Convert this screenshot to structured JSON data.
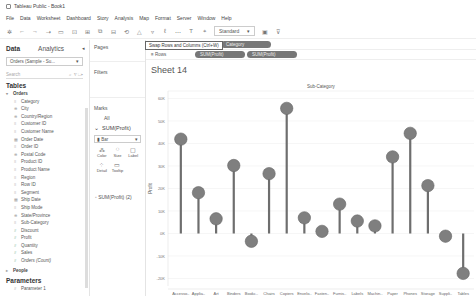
{
  "window": {
    "title": "Tableau Public - Book1"
  },
  "menu": [
    "File",
    "Data",
    "Worksheet",
    "Dashboard",
    "Story",
    "Analysis",
    "Map",
    "Format",
    "Server",
    "Window",
    "Help"
  ],
  "toolbar": {
    "icons": [
      "tableau-logo-icon",
      "back-icon",
      "forward-icon",
      "redo-icon",
      "save-icon",
      "new-datasource-icon",
      "new-sheet-icon",
      "duplicate-icon",
      "clear-icon",
      "swap-icon",
      "sort-asc-icon",
      "sort-desc-icon",
      "highlight-icon",
      "group-icon",
      "label-icon",
      "pin-icon"
    ],
    "fit_dropdown": "Standard",
    "tooltip": "Swap Rows and Columns (Ctrl+W)"
  },
  "left_pane": {
    "tabs": [
      "Data",
      "Analytics"
    ],
    "active_tab": "Data",
    "datasource": "Orders (Sample - Su...",
    "search_placeholder": "Search",
    "tables_heading": "Tables",
    "table_name": "Orders",
    "fields": [
      {
        "name": "Category",
        "type": "dim"
      },
      {
        "name": "City",
        "type": "geo"
      },
      {
        "name": "Country/Region",
        "type": "geo"
      },
      {
        "name": "Customer ID",
        "type": "dim"
      },
      {
        "name": "Customer Name",
        "type": "dim"
      },
      {
        "name": "Order Date",
        "type": "date"
      },
      {
        "name": "Order ID",
        "type": "dim"
      },
      {
        "name": "Postal Code",
        "type": "geo"
      },
      {
        "name": "Product ID",
        "type": "dim"
      },
      {
        "name": "Product Name",
        "type": "dim"
      },
      {
        "name": "Region",
        "type": "dim"
      },
      {
        "name": "Row ID",
        "type": "dim"
      },
      {
        "name": "Segment",
        "type": "dim"
      },
      {
        "name": "Ship Date",
        "type": "date"
      },
      {
        "name": "Ship Mode",
        "type": "dim"
      },
      {
        "name": "State/Province",
        "type": "geo"
      },
      {
        "name": "Sub-Category",
        "type": "dim"
      },
      {
        "name": "Discount",
        "type": "measure"
      },
      {
        "name": "Profit",
        "type": "measure"
      },
      {
        "name": "Quantity",
        "type": "measure"
      },
      {
        "name": "Sales",
        "type": "measure"
      },
      {
        "name": "Orders (Count)",
        "type": "measure",
        "italic": true
      }
    ],
    "people_table": "People",
    "parameters_heading": "Parameters",
    "parameters": [
      "Parameter 1"
    ]
  },
  "shelves": {
    "pages_label": "Pages",
    "filters_label": "Filters",
    "marks_label": "Marks",
    "marks_all": "All",
    "marks_measure": "SUM(Profit)",
    "mark_type": "Bar",
    "mark_buttons": [
      {
        "label": "Color",
        "icon": "color-icon"
      },
      {
        "label": "Size",
        "icon": "size-icon"
      },
      {
        "label": "Label",
        "icon": "label-icon"
      },
      {
        "label": "Detail",
        "icon": "detail-icon"
      },
      {
        "label": "Tooltip",
        "icon": "tooltip-icon"
      }
    ],
    "marks_measure_2": "SUM(Profit) (2)",
    "columns_label": "Columns",
    "columns_pills": [
      "Category"
    ],
    "rows_label": "Rows",
    "rows_pills": [
      "SUM(Profit)",
      "SUM(Profit)"
    ]
  },
  "sheet": {
    "title": "Sheet 14"
  },
  "chart_data": {
    "type": "bar",
    "subtype": "lollipop",
    "title": "Sheet 14",
    "header": "Sub-Category",
    "xlabel": "",
    "ylabel": "Profit",
    "categories": [
      "Accesso..",
      "Applia..",
      "Art",
      "Binders",
      "Bookc..",
      "Chairs",
      "Copiers",
      "Envelo..",
      "Fasten..",
      "Furnis..",
      "Labels",
      "Machin..",
      "Paper",
      "Phones",
      "Storage",
      "Suppli..",
      "Tables"
    ],
    "category_full_names": [
      "Accessories",
      "Appliances",
      "Art",
      "Binders",
      "Bookcases",
      "Chairs",
      "Copiers",
      "Envelopes",
      "Fasteners",
      "Furnishings",
      "Labels",
      "Machines",
      "Paper",
      "Phones",
      "Storage",
      "Supplies",
      "Tables"
    ],
    "values": [
      41937,
      18138,
      6528,
      30222,
      -3473,
      26590,
      55618,
      6964,
      950,
      13059,
      5546,
      3385,
      34054,
      44516,
      21279,
      -1189,
      -17725
    ],
    "yticks": [
      "60K",
      "50K",
      "40K",
      "30K",
      "20K",
      "10K",
      "0K",
      "-10K",
      "-20K"
    ],
    "ylim": [
      -22000,
      62000
    ],
    "grid": true,
    "legend": "none",
    "mark_color": "#7f7f7f",
    "stem_color": "#6e6e6e"
  }
}
